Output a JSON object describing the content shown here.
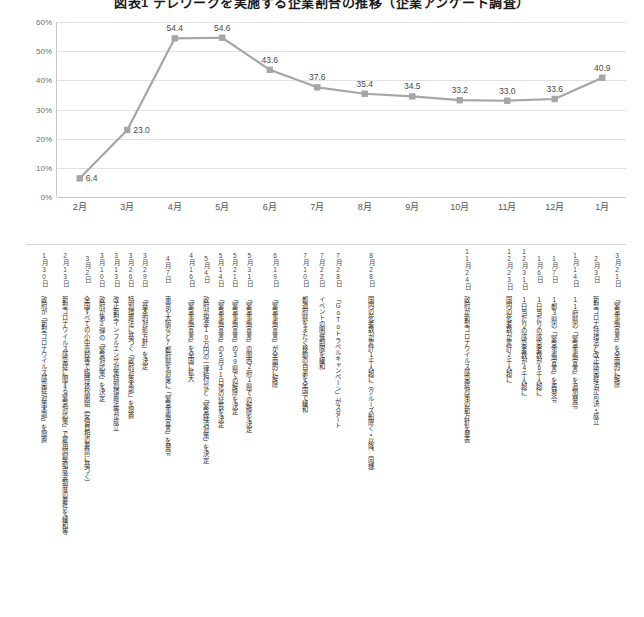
{
  "chart_title": "図表1 テレワークを実施する企業割合の推移（企業アンケート調査）",
  "chart_data": {
    "type": "line",
    "title": "図表1 テレワークを実施する企業割合の推移（企業アンケート調査）",
    "xlabel": "",
    "ylabel": "",
    "ylim": [
      0,
      60
    ],
    "ytick_labels": [
      "0%",
      "10%",
      "20%",
      "30%",
      "40%",
      "50%",
      "60%"
    ],
    "ytick_values": [
      0,
      10,
      20,
      30,
      40,
      50,
      60
    ],
    "grid": true,
    "legend": "none",
    "categories": [
      "2月",
      "3月",
      "4月",
      "5月",
      "6月",
      "7月",
      "8月",
      "9月",
      "10月",
      "11月",
      "12月",
      "1月"
    ],
    "values": [
      6.4,
      23.0,
      54.4,
      54.6,
      43.6,
      37.6,
      35.4,
      34.5,
      33.2,
      33.0,
      33.6,
      40.9
    ],
    "data_labels": [
      "6.4",
      "23.0",
      "54.4",
      "54.6",
      "43.6",
      "37.6",
      "35.4",
      "34.5",
      "33.2",
      "33.0",
      "33.6",
      "40.9"
    ],
    "series_color": "#a6a6a6",
    "marker": "square"
  },
  "timeline": {
    "events": [
      {
        "date": "1月30日",
        "x": 3.0,
        "note": "政府が「新型コロナウイルス感染症対策本部」を設置"
      },
      {
        "date": "2月13日",
        "x": 6.5,
        "note": "新型コロナウイルス感染症に関する緊急対応策」で雇用調整助成金制度の要件を緩和等"
      },
      {
        "date": "3月2日",
        "x": 10.2,
        "note": "全国すべての小中高校等で臨時休校開始（安倍首相の要請に基づく）"
      },
      {
        "date": "3月10日",
        "x": 12.6,
        "note": "政府が第2弾の「緊急対応策」を決定"
      },
      {
        "date": "3月13日",
        "x": 15.0,
        "note": "改正新型インフルエンザ対策特別措置法等が成立"
      },
      {
        "date": "3月26日",
        "x": 17.4,
        "note": "特別措置法に基づく「政府対策本部」を設置"
      },
      {
        "date": "3月29日",
        "x": 19.8,
        "note": "「基本的対処方針」を決定"
      },
      {
        "date": "4月7日",
        "x": 23.6,
        "note": "東京や大阪など7都府県を対象に「緊急事態宣言」を発令"
      },
      {
        "date": "4月16日",
        "x": 27.5,
        "note": "「緊急事態宣言」を全国に拡大"
      },
      {
        "date": "5月4日",
        "x": 30.0,
        "note": "政府が現金10万円の一律給付など「緊急経済対策」を決定"
      },
      {
        "date": "5月14日",
        "x": 32.4,
        "note": "「緊急事態宣言」の5月31日迄の延長を決定"
      },
      {
        "date": "5月21日",
        "x": 34.8,
        "note": "「緊急事態宣言」の39県での解除を決定"
      },
      {
        "date": "5月31日",
        "x": 37.2,
        "note": "「緊急事態宣言」の関西2府1県での解除を決定"
      },
      {
        "date": "6月19日",
        "x": 41.5,
        "note": "「緊急事態宣言」が全面的に解除"
      },
      {
        "date": "7月10日",
        "x": 46.5,
        "note": "都道府県をまたぐ移動の自粛を全国で緩和"
      },
      {
        "date": "7月22日",
        "x": 49.3,
        "note": "イベントの開催制限を緩和"
      },
      {
        "date": "7月28日",
        "x": 52.0,
        "note": "「GoToトラベルキャンペーン」がスタート"
      },
      {
        "date": "8月28日",
        "x": 57.5,
        "note": "国内の死者数が累計1千人超に（クルーズ船除く・以降、同様）"
      },
      {
        "date": "11月24日",
        "x": 73.5,
        "note": "政府が新型コロナウイルス感染症対策の新方針を発表"
      },
      {
        "date": "12月23日",
        "x": 80.5,
        "note": "国内の死者数が累計2千人超に"
      },
      {
        "date": "12月31日",
        "x": 83.0,
        "note": "1日当たりの感染者数が4千人超に"
      },
      {
        "date": "1月6日",
        "x": 85.5,
        "note": "1日当たりの感染者数が6千人超に"
      },
      {
        "date": "1月7日",
        "x": 88.0,
        "note": "1都3県の「緊急事態宣言」を再発令"
      },
      {
        "date": "1月14日",
        "x": 91.5,
        "note": "11府県の「緊急事態宣言」を追加発令"
      },
      {
        "date": "2月3日",
        "x": 95.0,
        "note": "新型コロナ特措法と改正感染症法が可決・成立"
      },
      {
        "date": "3月21日",
        "x": 98.5,
        "note": "「緊急事態宣言」を全面的に解除"
      }
    ]
  }
}
